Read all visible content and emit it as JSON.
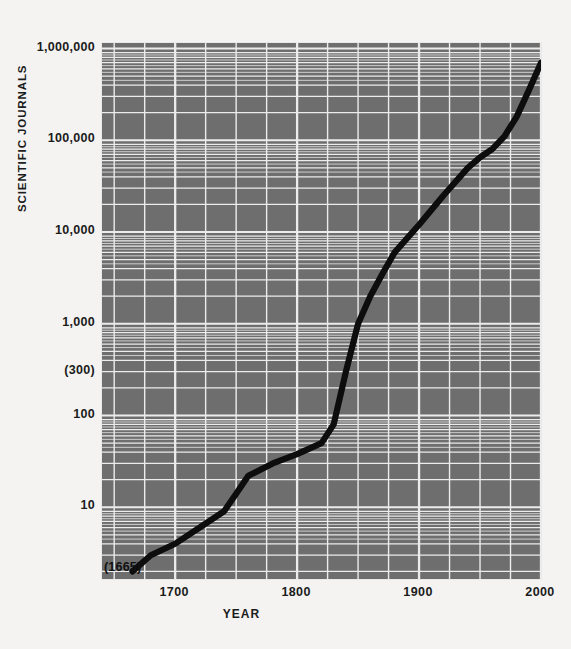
{
  "chart_data": {
    "type": "line",
    "title": "",
    "xlabel": "YEAR",
    "ylabel": "SCIENTIFIC JOURNALS",
    "yscale": "log",
    "xlim": [
      1640,
      2000
    ],
    "ylim": [
      1.6,
      1000000
    ],
    "grid": true,
    "legend": null,
    "xticks": [
      1700,
      1800,
      1900,
      2000
    ],
    "xtick_labels": [
      "1700",
      "1800",
      "1900",
      "2000"
    ],
    "yticks": [
      10,
      100,
      300,
      1000,
      10000,
      100000,
      1000000
    ],
    "ytick_labels": [
      "10",
      "100",
      "(300)",
      "1,000",
      "10,000",
      "100,000",
      "1,000,000"
    ],
    "annotations": [
      {
        "text": "(1665)",
        "x": 1665,
        "y": 2
      }
    ],
    "series": [
      {
        "name": "Scientific journals",
        "x": [
          1665,
          1680,
          1700,
          1720,
          1740,
          1750,
          1760,
          1780,
          1800,
          1820,
          1830,
          1840,
          1850,
          1860,
          1870,
          1880,
          1900,
          1920,
          1940,
          1950,
          1960,
          1970,
          1980,
          1990,
          2000
        ],
        "values": [
          2,
          3,
          4,
          6,
          9,
          14,
          22,
          30,
          38,
          50,
          80,
          300,
          1000,
          2000,
          3500,
          6000,
          12000,
          25000,
          50000,
          65000,
          80000,
          110000,
          180000,
          350000,
          700000
        ]
      }
    ]
  },
  "axes": {
    "y_title": "SCIENTIFIC JOURNALS",
    "x_title": "YEAR"
  },
  "style": {
    "plot_background": "#6e6e6e",
    "grid_color": "#ececec",
    "line_color": "#0d0d0d",
    "text_color": "#1b1b1b",
    "figure_background": "#f4f3f1"
  }
}
